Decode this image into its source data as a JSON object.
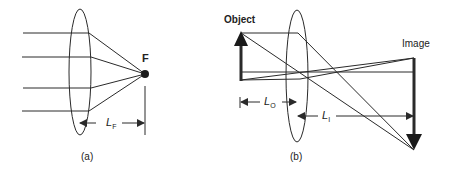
{
  "panels": [
    {
      "id": "a",
      "caption": "(a)",
      "focal_label": "F",
      "distance_label": {
        "main": "L",
        "sub": "F"
      },
      "description": "Parallel rays converging through a lens to focal point F"
    },
    {
      "id": "b",
      "caption": "(b)",
      "object_label": "Object",
      "image_label": "Image",
      "object_distance_label": {
        "main": "L",
        "sub": "O"
      },
      "image_distance_label": {
        "main": "L",
        "sub": "I"
      },
      "description": "Lens forming an inverted, magnified image of an object"
    }
  ],
  "colors": {
    "line": "#2a2a2a",
    "background": "#ffffff"
  }
}
